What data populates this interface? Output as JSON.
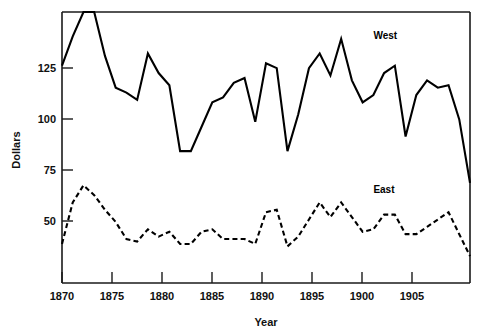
{
  "chart_data": {
    "type": "line",
    "title": "",
    "xlabel": "Year",
    "ylabel": "Dollars",
    "xlim": [
      1870,
      1908
    ],
    "ylim": [
      36,
      147
    ],
    "grid": false,
    "legend_position": "inline-right-of-series",
    "x_ticks": [
      1870,
      1875,
      1880,
      1885,
      1890,
      1895,
      1900,
      1905
    ],
    "x_tick_labels": [
      "1870",
      "1875",
      "1880",
      "1885",
      "1890",
      "1895",
      "1900",
      "1905"
    ],
    "y_ticks": [
      50,
      75,
      100,
      125
    ],
    "y_tick_labels": [
      "50",
      "75",
      "100",
      "125"
    ],
    "x": [
      1870,
      1871,
      1872,
      1873,
      1874,
      1875,
      1876,
      1877,
      1878,
      1879,
      1880,
      1881,
      1882,
      1883,
      1884,
      1885,
      1886,
      1887,
      1888,
      1889,
      1890,
      1891,
      1892,
      1893,
      1894,
      1895,
      1896,
      1897,
      1898,
      1899,
      1900,
      1901,
      1902,
      1903,
      1904,
      1905,
      1906,
      1907,
      1908
    ],
    "series": [
      {
        "name": "West",
        "style": "solid",
        "color": "#000000",
        "label_x": 1899,
        "label_y": 136,
        "values": [
          125,
          137,
          147,
          147,
          129,
          116,
          114,
          111,
          130,
          122,
          117,
          90,
          90,
          100,
          110,
          112,
          118,
          120,
          102,
          126,
          124,
          90,
          105,
          124,
          130,
          121,
          136,
          119,
          110,
          113,
          122,
          125,
          96,
          113,
          119,
          116,
          117,
          103,
          77
        ]
      },
      {
        "name": "East",
        "style": "dashed",
        "color": "#000000",
        "label_x": 1899,
        "label_y": 73,
        "values": [
          52,
          69,
          76,
          72,
          66,
          61,
          54,
          53,
          58,
          55,
          57,
          52,
          52,
          57,
          58,
          54,
          54,
          54,
          52,
          65,
          66,
          51,
          55,
          62,
          69,
          63,
          69,
          63,
          57,
          58,
          64,
          64,
          56,
          56,
          59,
          62,
          65,
          56,
          47
        ]
      }
    ]
  },
  "labels": {
    "y_axis_title": "Dollars",
    "x_axis_title": "Year"
  }
}
